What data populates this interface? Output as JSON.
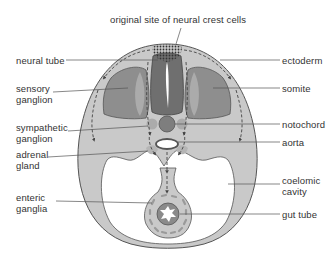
{
  "diagram": {
    "type": "cross-section",
    "colors": {
      "background": "#ffffff",
      "outer_body": "#c9c9c9",
      "outline": "#555555",
      "neural_tube": "#6f6f6f",
      "somite": "#8e8e8e",
      "somite_inner": "#b3b3b3",
      "notochord": "#7e7e7e",
      "sympathetic_ganglion": "#ababab",
      "gut_wall": "#8a8a8a",
      "cavity": "#ffffff",
      "leader_line": "#555555",
      "label_text": "#333333"
    },
    "labels": {
      "top": "original site of neural crest cells",
      "left": [
        "neural tube",
        "sensory\nganglion",
        "sympathetic\nganglion",
        "adrenal\ngland",
        "enteric\nganglia"
      ],
      "right": [
        "ectoderm",
        "somite",
        "notochord",
        "aorta",
        "coelomic\ncavity",
        "gut tube"
      ]
    }
  }
}
